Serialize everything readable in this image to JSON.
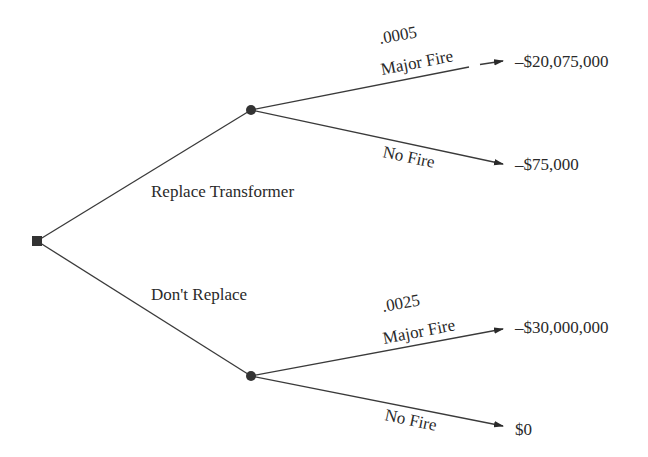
{
  "diagram": {
    "type": "decision-tree",
    "decision_node": {
      "shape": "square",
      "x": 37,
      "y": 241
    },
    "decisions": [
      {
        "label": "Replace Transformer",
        "chance_node": {
          "x": 251,
          "y": 110
        },
        "outcomes": [
          {
            "name": "Major Fire",
            "probability": ".0005",
            "value": "–$20,075,000"
          },
          {
            "name": "No Fire",
            "probability": "",
            "value": "–$75,000"
          }
        ]
      },
      {
        "label": "Don't Replace",
        "chance_node": {
          "x": 251,
          "y": 376
        },
        "outcomes": [
          {
            "name": "Major Fire",
            "probability": ".0025",
            "value": "–$30,000,000"
          },
          {
            "name": "No Fire",
            "probability": "",
            "value": "$0"
          }
        ]
      }
    ],
    "colors": {
      "line": "#3a3a3a",
      "node": "#333333",
      "text": "#2a2a2a",
      "background": "#ffffff"
    }
  }
}
